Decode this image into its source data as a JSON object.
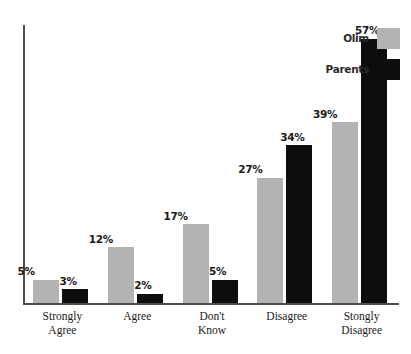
{
  "chart_data": {
    "type": "bar",
    "title": "",
    "subtitle": "",
    "xlabel": "",
    "ylabel": "",
    "ylim": [
      0,
      60
    ],
    "grid": false,
    "legend_position": "top-right",
    "value_suffix": "%",
    "categories": [
      "Strongly Agree",
      "Agree",
      "Don't Know",
      "Disagree",
      "Stongly Disagree"
    ],
    "category_lines": [
      [
        "Strongly",
        "Agree"
      ],
      [
        "Agree",
        ""
      ],
      [
        "Don't",
        "Know"
      ],
      [
        "Disagree",
        ""
      ],
      [
        "Stongly",
        "Disagree"
      ]
    ],
    "series": [
      {
        "name": "Olim",
        "color": "#b3b3b3",
        "values": [
          5,
          12,
          17,
          27,
          39
        ],
        "labels": [
          "5%",
          "12%",
          "17%",
          "27%",
          "39%"
        ]
      },
      {
        "name": "Parents",
        "color": "#0d0d0d",
        "values": [
          3,
          2,
          5,
          34,
          57
        ],
        "labels": [
          "3%",
          "2%",
          "5%",
          "34%",
          "57%"
        ]
      }
    ]
  },
  "axis": {
    "color": "#4d4d4d"
  },
  "legend": {
    "entries": [
      {
        "label": "Olim",
        "color": "#b3b3b3"
      },
      {
        "label": "Parents",
        "color": "#0d0d0d"
      }
    ]
  }
}
